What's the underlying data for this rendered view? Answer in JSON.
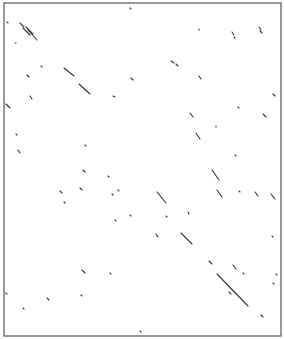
{
  "chart_data": {
    "type": "scatter",
    "subtype": "dot-plot",
    "title": "",
    "xlabel": "",
    "ylabel": "",
    "grid": false,
    "frame": {
      "x1": 4,
      "y1": 3,
      "x2": 281,
      "y2": 336,
      "color": "#555555"
    },
    "line_color": "#333333",
    "segments": [
      [
        20,
        23,
        24,
        27
      ],
      [
        23,
        28,
        30,
        35
      ],
      [
        26,
        27,
        33,
        34
      ],
      [
        28,
        30,
        37,
        40
      ],
      [
        7,
        22,
        8,
        23
      ],
      [
        15,
        43,
        16,
        43
      ],
      [
        27,
        75,
        29,
        77
      ],
      [
        41,
        66,
        42,
        67
      ],
      [
        64,
        68,
        74,
        76
      ],
      [
        79,
        84,
        90,
        94
      ],
      [
        113,
        96,
        115,
        97
      ],
      [
        130,
        8,
        131,
        9
      ],
      [
        199,
        29,
        199,
        30
      ],
      [
        232,
        32,
        234,
        35
      ],
      [
        234,
        37,
        235,
        38
      ],
      [
        259,
        27,
        261,
        30
      ],
      [
        260,
        31,
        262,
        33
      ],
      [
        171,
        61,
        174,
        63
      ],
      [
        176,
        64,
        178,
        66
      ],
      [
        199,
        76,
        201,
        79
      ],
      [
        131,
        78,
        133,
        80
      ],
      [
        6,
        104,
        10,
        108
      ],
      [
        30,
        96,
        32,
        99
      ],
      [
        273,
        94,
        275,
        96
      ],
      [
        238,
        107,
        239,
        108
      ],
      [
        190,
        113,
        193,
        117
      ],
      [
        263,
        114,
        266,
        117
      ],
      [
        216,
        126,
        216,
        127
      ],
      [
        196,
        133,
        200,
        139
      ],
      [
        16,
        134,
        17,
        135
      ],
      [
        18,
        150,
        20,
        153
      ],
      [
        85,
        145,
        86,
        146
      ],
      [
        235,
        155,
        236,
        156
      ],
      [
        212,
        170,
        219,
        180
      ],
      [
        83,
        170,
        85,
        172
      ],
      [
        108,
        176,
        109,
        177
      ],
      [
        60,
        191,
        62,
        193
      ],
      [
        80,
        188,
        82,
        190
      ],
      [
        118,
        190,
        119,
        191
      ],
      [
        112,
        194,
        113,
        195
      ],
      [
        64,
        202,
        65,
        203
      ],
      [
        157,
        192,
        166,
        203
      ],
      [
        217,
        190,
        222,
        197
      ],
      [
        239,
        191,
        240,
        192
      ],
      [
        255,
        192,
        258,
        196
      ],
      [
        271,
        194,
        275,
        199
      ],
      [
        166,
        216,
        167,
        217
      ],
      [
        188,
        212,
        189,
        214
      ],
      [
        130,
        215,
        131,
        216
      ],
      [
        115,
        220,
        116,
        221
      ],
      [
        156,
        234,
        158,
        237
      ],
      [
        181,
        233,
        192,
        244
      ],
      [
        82,
        270,
        85,
        273
      ],
      [
        110,
        273,
        111,
        274
      ],
      [
        209,
        261,
        212,
        264
      ],
      [
        233,
        265,
        236,
        269
      ],
      [
        217,
        274,
        248,
        306
      ],
      [
        229,
        292,
        231,
        294
      ],
      [
        261,
        315,
        263,
        317
      ],
      [
        6,
        293,
        7,
        294
      ],
      [
        23,
        308,
        24,
        309
      ],
      [
        47,
        298,
        49,
        300
      ],
      [
        81,
        295,
        82,
        296
      ],
      [
        140,
        331,
        141,
        332
      ],
      [
        273,
        283,
        274,
        284
      ],
      [
        276,
        274,
        277,
        275
      ],
      [
        243,
        273,
        244,
        274
      ],
      [
        272,
        236,
        273,
        237
      ]
    ]
  }
}
